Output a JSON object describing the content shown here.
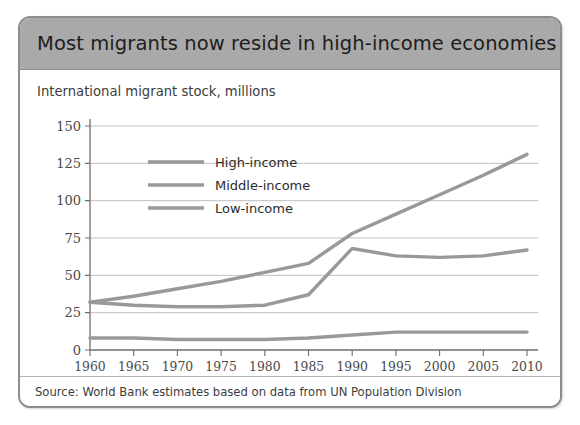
{
  "figure": {
    "header_title": "Most migrants now reside in high-income economies",
    "subtitle": "International migrant stock, millions",
    "source_note": "Source: World Bank estimates based on data from UN Population Division",
    "header_color": "#a9a9a9",
    "border_color": "#8d8d8d",
    "series_color": "#999999",
    "gridline_color": "#b9b9b9"
  },
  "chart_data": {
    "type": "line",
    "title": "Most migrants now reside in high-income economies",
    "subtitle": "International migrant stock, millions",
    "xlabel": "",
    "ylabel": "International migrant stock, millions",
    "x": [
      1960,
      1965,
      1970,
      1975,
      1980,
      1985,
      1990,
      1995,
      2000,
      2005,
      2010
    ],
    "xtick_labels": [
      "1960",
      "1965",
      "1970",
      "1975",
      "1980",
      "1985",
      "1990",
      "1995",
      "2000",
      "2005",
      "2010"
    ],
    "ytick_labels": [
      "0",
      "25",
      "50",
      "75",
      "100",
      "125",
      "150"
    ],
    "yticks": [
      0,
      25,
      50,
      75,
      100,
      125,
      150
    ],
    "xlim": [
      1960,
      2010
    ],
    "ylim": [
      0,
      150
    ],
    "grid": "horizontal",
    "legend_position": "top-left-inside",
    "series": [
      {
        "name": "High-income",
        "color": "#999999",
        "values": [
          32,
          36,
          41,
          46,
          52,
          58,
          78,
          91,
          104,
          117,
          131
        ]
      },
      {
        "name": "Middle-income",
        "color": "#999999",
        "values": [
          32,
          30,
          29,
          29,
          30,
          37,
          68,
          63,
          62,
          63,
          67
        ]
      },
      {
        "name": "Low-income",
        "color": "#999999",
        "values": [
          8,
          8,
          7,
          7,
          7,
          8,
          10,
          12,
          12,
          12,
          12
        ]
      }
    ]
  },
  "legend": {
    "items": [
      {
        "label": "High-income"
      },
      {
        "label": "Middle-income"
      },
      {
        "label": "Low-income"
      }
    ]
  }
}
